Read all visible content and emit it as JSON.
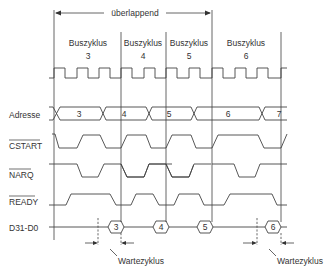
{
  "overlap_label": "überlappend",
  "cycles": [
    {
      "title": "Buszyklus",
      "number": "3",
      "x": 88
    },
    {
      "title": "Buszyklus",
      "number": "4",
      "x": 143
    },
    {
      "title": "Buszyklus",
      "number": "5",
      "x": 189
    },
    {
      "title": "Buszyklus",
      "number": "6",
      "x": 246
    }
  ],
  "signals": [
    {
      "name": "Adresse",
      "overline": false,
      "y": 118
    },
    {
      "name": "CSTART",
      "overline": true,
      "y": 149
    },
    {
      "name": "NARQ",
      "overline": true,
      "y": 178
    },
    {
      "name": "READY",
      "overline": true,
      "y": 205
    },
    {
      "name": "D31-D0",
      "overline": false,
      "y": 231
    }
  ],
  "address_values": [
    "3",
    "4",
    "5",
    "6",
    "7"
  ],
  "data_values": [
    "3",
    "4",
    "5",
    "6"
  ],
  "wait_label": "Wartezyklus",
  "wait_annotations": [
    "Wartezyklus",
    "Wartezyklus"
  ],
  "colors": {
    "line": "#444444",
    "text": "#333333",
    "background": "#ffffff"
  }
}
